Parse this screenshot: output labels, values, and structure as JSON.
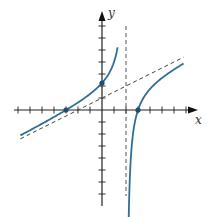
{
  "chart_data": {
    "type": "line",
    "title": "",
    "xlabel": "x",
    "ylabel": "y",
    "function": "y = x/2 + 1 - 2.5/(x - 2)",
    "xlim": [
      -7,
      7.5
    ],
    "ylim": [
      -8,
      8
    ],
    "grid": false,
    "tick_spacing": 1,
    "x_ticks": [
      -7,
      -6,
      -5,
      -4,
      -3,
      -2,
      -1,
      1,
      2,
      3,
      4,
      5,
      6,
      7
    ],
    "y_ticks": [
      -7,
      -6,
      -5,
      -4,
      -3,
      -2,
      -1,
      1,
      2,
      3,
      4,
      5,
      6,
      7
    ],
    "vertical_asymptote": {
      "x": 2,
      "style": "dashed"
    },
    "slant_asymptote": {
      "equation": "y = x/2 + 1",
      "slope": 0.5,
      "intercept": 1,
      "style": "dashed"
    },
    "marked_points": [
      {
        "x": -3,
        "y": 0,
        "label": "x-intercept"
      },
      {
        "x": 0,
        "y": 2.25,
        "label": "y-intercept"
      },
      {
        "x": 3,
        "y": 0,
        "label": "x-intercept"
      }
    ],
    "series": [
      {
        "name": "left-branch",
        "x_range": [
          -6.8,
          1.3
        ]
      },
      {
        "name": "right-branch",
        "x_range": [
          2.08,
          6.8
        ]
      }
    ],
    "colors": {
      "curve": "#2f6f95",
      "axis": "#222222",
      "asymptote": "#555555"
    }
  },
  "labels": {
    "x_axis": "x",
    "y_axis": "y"
  }
}
